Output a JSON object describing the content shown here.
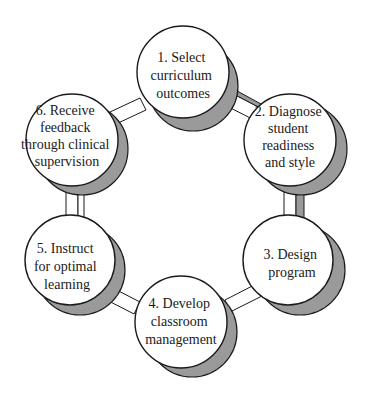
{
  "diagram": {
    "type": "cycle",
    "colors": {
      "shadow": "#9a9a9a",
      "outline": "#1a1a1a",
      "fill": "#ffffff"
    },
    "nodes": [
      {
        "id": 1,
        "label": "1. Select curriculum outcomes",
        "lines": [
          "1. Select",
          "curriculum",
          "outcomes"
        ]
      },
      {
        "id": 2,
        "label": "2. Diagnose student readiness and style",
        "lines": [
          "2. Diagnose",
          "student",
          "readiness",
          "and style"
        ]
      },
      {
        "id": 3,
        "label": "3. Design program",
        "lines": [
          "3. Design",
          "program"
        ]
      },
      {
        "id": 4,
        "label": "4. Develop classroom management",
        "lines": [
          "4. Develop",
          "classroom",
          "management"
        ]
      },
      {
        "id": 5,
        "label": "5. Instruct for optimal learning",
        "lines": [
          "5. Instruct",
          "for optimal",
          "learning"
        ]
      },
      {
        "id": 6,
        "label": "6. Receive feedback through clinical supervision",
        "lines": [
          "6. Receive",
          "feedback",
          "through clinical",
          "supervision"
        ]
      }
    ],
    "edges": [
      [
        1,
        2
      ],
      [
        2,
        3
      ],
      [
        3,
        4
      ],
      [
        4,
        5
      ],
      [
        5,
        6
      ],
      [
        6,
        1
      ]
    ]
  }
}
